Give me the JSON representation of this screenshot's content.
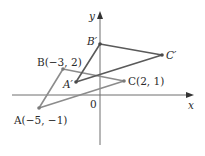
{
  "diagram": {
    "axes": {
      "x_label": "x",
      "y_label": "y",
      "origin_label": "0"
    },
    "original_triangle": {
      "color": "#8c8c8c",
      "vertices": [
        {
          "name": "A",
          "label": "A(−5, −1)",
          "x": -5,
          "y": -1
        },
        {
          "name": "B",
          "label": "B(−3, 2)",
          "x": -3,
          "y": 2
        },
        {
          "name": "C",
          "label": "C(2, 1)",
          "x": 2,
          "y": 1
        }
      ]
    },
    "image_triangle": {
      "color": "#5a5a5a",
      "vertices": [
        {
          "name": "A'",
          "label": "A′"
        },
        {
          "name": "B'",
          "label": "B′"
        },
        {
          "name": "C'",
          "label": "C′"
        }
      ]
    }
  }
}
